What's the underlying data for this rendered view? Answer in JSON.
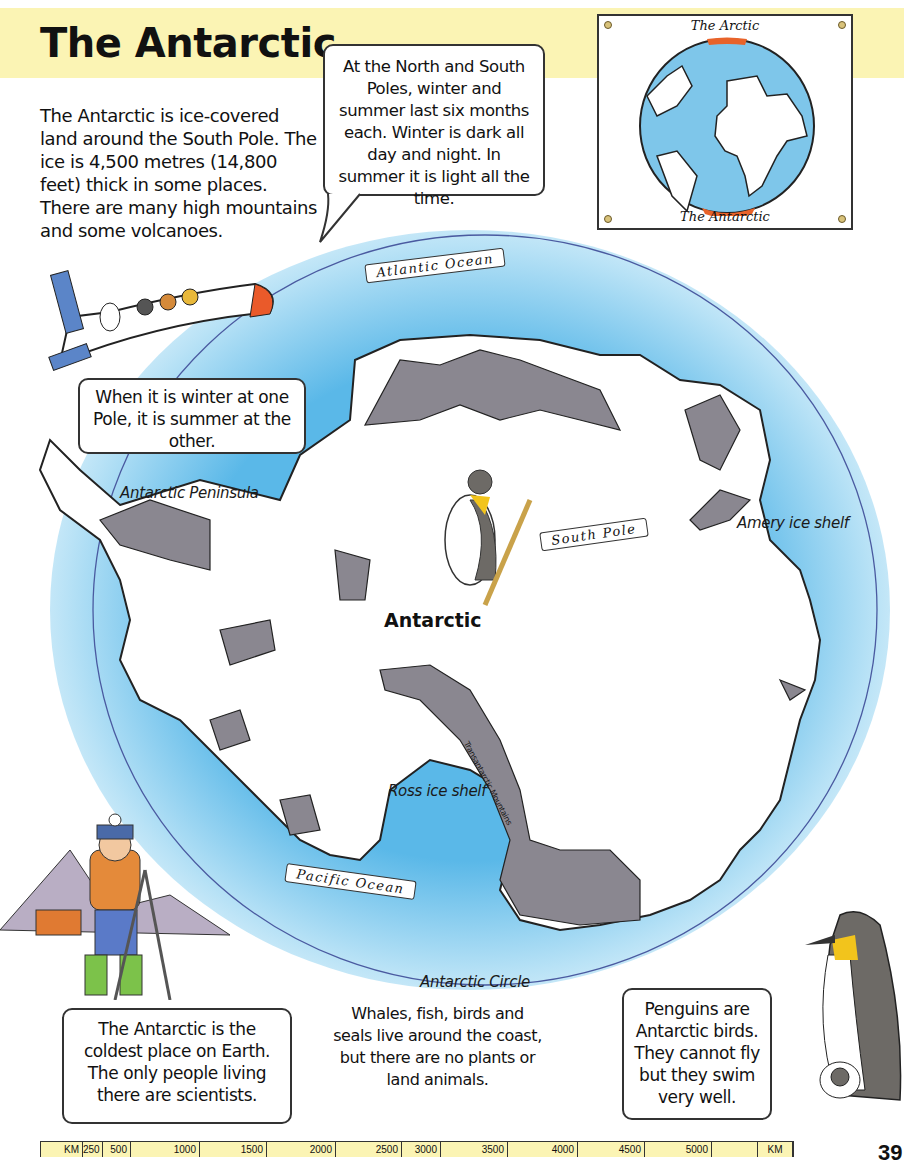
{
  "page": {
    "title": "The Antarctic",
    "intro": "The Antarctic is ice-covered land around the South Pole. The ice is 4,500 metres (14,800 feet) thick in some places. There are many high mountains and some volcanoes.",
    "page_number": "39"
  },
  "bubbles": {
    "poles": "At the North and South Poles, winter and summer last six months each. Winter is dark all day and night. In summer it is light all the time.",
    "seasons": "When it is winter at one Pole, it is summer at the other.",
    "coldest": "The Antarctic is the coldest place on Earth. The only people living there are scientists.",
    "penguins": "Penguins are Antarctic birds. They cannot fly but they swim very well."
  },
  "caption": "Whales, fish, birds and seals live around the coast, but there are no plants or land animals.",
  "inset_globe": {
    "top_label": "The Arctic",
    "bottom_label": "The Antarctic"
  },
  "map": {
    "continent_label": "Antarctic",
    "labels": {
      "peninsula": "Antarctic Peninsula",
      "amery": "Amery ice shelf",
      "ross": "Ross ice shelf",
      "transantarctic": "Transantarctic Mountains",
      "circle": "Antarctic Circle"
    },
    "banners": {
      "atlantic": "Atlantic Ocean",
      "pacific": "Pacific Ocean",
      "south_pole": "South Pole"
    },
    "colors": {
      "ocean": "#5ab8e8",
      "land": "#ffffff",
      "mountain": "#8a8790",
      "circle_line": "#4a5aa0"
    }
  },
  "scale_bar": {
    "unit_left": "KM",
    "ticks": [
      "250",
      "500",
      "1000",
      "1500",
      "2000",
      "2500",
      "3000",
      "3500",
      "4000",
      "4500",
      "5000",
      ""
    ],
    "unit_right": "KM"
  }
}
